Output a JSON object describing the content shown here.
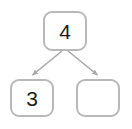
{
  "diagram": {
    "type": "tree",
    "background_color": "#ffffff",
    "node_border_color": "#b9b9b9",
    "node_fill_color": "#ffffff",
    "edge_color": "#a9a9a9",
    "label_color": "#1b1b1b",
    "nodes": [
      {
        "id": "root",
        "label": "4",
        "empty": false
      },
      {
        "id": "left",
        "label": "3",
        "empty": false
      },
      {
        "id": "right",
        "label": "",
        "empty": true
      }
    ],
    "edges": [
      {
        "from": "root",
        "to": "left",
        "arrow": true
      },
      {
        "from": "root",
        "to": "right",
        "arrow": true
      }
    ]
  }
}
